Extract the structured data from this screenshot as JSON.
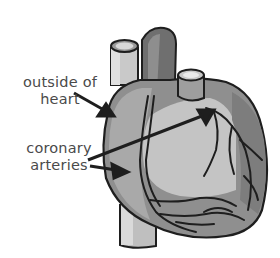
{
  "diagram": {
    "subject": "heart",
    "labels": [
      {
        "id": "outside-of-heart",
        "lines": [
          "outside of",
          "heart"
        ]
      },
      {
        "id": "coronary-arteries",
        "lines": [
          "coronary",
          "arteries"
        ]
      }
    ],
    "colors": {
      "outline": "#1e1e1e",
      "light_gray": "#c4c4c4",
      "mid_gray": "#9c9c9c",
      "dark_gray": "#6f6f6f",
      "vessel_light": "#d6d6d6",
      "text": "#4a4a4a"
    }
  }
}
